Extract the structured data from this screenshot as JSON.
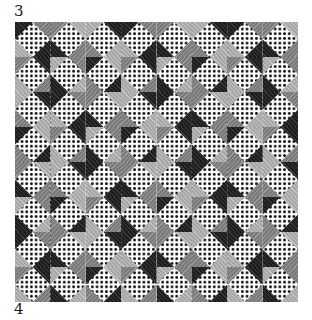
{
  "page": {
    "top_number": "3",
    "bottom_number": "4"
  },
  "swatch": {
    "description": "Needlepoint stitch sample on canvas",
    "grid_cols": 8,
    "grid_rows": 8,
    "colors": {
      "dark": "#1e1e1e",
      "mid": "#7a7a7a",
      "light": "#a8a8a8",
      "canvas": "#ffffff",
      "canvas_holes": "#111111"
    }
  }
}
